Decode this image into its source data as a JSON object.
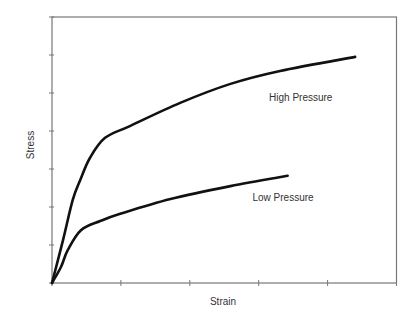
{
  "chart_data": {
    "type": "line",
    "title": "",
    "xlabel": "Strain",
    "ylabel": "Stress",
    "xlim": [
      0,
      5
    ],
    "ylim": [
      0,
      7
    ],
    "x_ticks": [
      0,
      1,
      2,
      3,
      4,
      5
    ],
    "y_ticks": [
      0,
      1,
      2,
      3,
      4,
      5,
      6,
      7
    ],
    "x_tick_labels": [],
    "y_tick_labels": [],
    "grid": false,
    "legend": "none (inline curve annotations)",
    "series": [
      {
        "name": "High Pressure",
        "label_position": [
          3.15,
          4.8
        ],
        "points": [
          [
            0,
            0
          ],
          [
            0.16,
            1.13
          ],
          [
            0.3,
            2.18
          ],
          [
            0.41,
            2.71
          ],
          [
            0.55,
            3.29
          ],
          [
            0.77,
            3.82
          ],
          [
            1.13,
            4.13
          ],
          [
            1.86,
            4.74
          ],
          [
            2.59,
            5.24
          ],
          [
            3.31,
            5.58
          ],
          [
            4.4,
            5.95
          ]
        ]
      },
      {
        "name": "Low Pressure",
        "label_position": [
          2.91,
          2.15
        ],
        "points": [
          [
            0,
            0
          ],
          [
            0.13,
            0.42
          ],
          [
            0.23,
            0.87
          ],
          [
            0.42,
            1.39
          ],
          [
            0.7,
            1.63
          ],
          [
            0.99,
            1.82
          ],
          [
            1.72,
            2.21
          ],
          [
            2.59,
            2.55
          ],
          [
            3.42,
            2.82
          ]
        ]
      }
    ]
  },
  "colors": {
    "frame": "#777777",
    "curve": "#111111",
    "text": "#333333"
  }
}
